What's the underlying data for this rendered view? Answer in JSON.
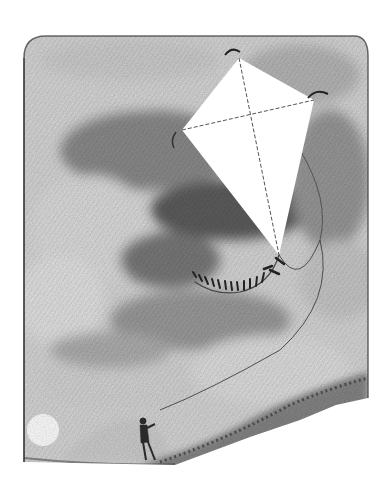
{
  "image": {
    "description": "Pencil illustration of a large white kite flying in a cloudy sky, its string trailing down to a small child standing on a grassy hillside; a white sun sits low at the lower left.",
    "style": "graphite pencil drawing, grayscale",
    "subjects": [
      "kite",
      "kite-tail",
      "kite-string",
      "child",
      "sun",
      "clouds",
      "hillside"
    ],
    "colors": {
      "paper": "#ffffff",
      "sky_light": "#d8d8d8",
      "sky_mid": "#a9a9a9",
      "sky_dark": "#6f6f6f",
      "graphite": "#2a2a2a",
      "kite": "#ffffff"
    }
  }
}
